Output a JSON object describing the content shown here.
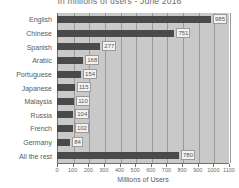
{
  "chart_data": {
    "type": "bar",
    "orientation": "horizontal",
    "title": "In millions of users - June 2016",
    "xlabel": "Millions of Users",
    "ylabel": "",
    "xlim": [
      0,
      1100
    ],
    "xticks": [
      0,
      100,
      200,
      300,
      400,
      500,
      600,
      700,
      800,
      900,
      1000,
      1100
    ],
    "grid": true,
    "legend": "none",
    "categories": [
      "English",
      "Chinese",
      "Spanish",
      "Arabic",
      "Portuguese",
      "Japanese",
      "Malaysia",
      "Russia",
      "French",
      "Germany",
      "All the rest"
    ],
    "values": [
      985,
      751,
      277,
      168,
      154,
      115,
      110,
      104,
      102,
      84,
      780
    ],
    "value_labels": [
      "985",
      "751",
      "277",
      "168",
      "154",
      "115",
      "110",
      "104",
      "102",
      "84",
      "780"
    ],
    "colors": {
      "bar": "#4a4a4a",
      "plot_background": "#c9c9c9",
      "page_background": "#ffffff",
      "gridline": "#9b9b9b",
      "axis": "#6f6f6f",
      "text": "#5a5a5a",
      "value_label_background": "#f2f2f2"
    }
  }
}
